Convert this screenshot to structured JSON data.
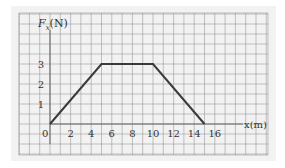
{
  "chart_data": {
    "type": "line",
    "title": "",
    "xlabel": "x(m)",
    "ylabel": "F_x(N)",
    "x": [
      0,
      5,
      10,
      15
    ],
    "series": [
      {
        "name": "F_x",
        "values": [
          0,
          3,
          3,
          0
        ]
      }
    ],
    "x_ticks": [
      "0",
      "2",
      "4",
      "6",
      "8",
      "10",
      "12",
      "14",
      "16"
    ],
    "y_ticks": [
      "1",
      "2",
      "3"
    ],
    "xlim": [
      -3,
      21
    ],
    "ylim": [
      -1.5,
      5.5
    ],
    "grid": true,
    "legend": "none"
  },
  "labels": {
    "ylabel_main": "F",
    "ylabel_sub": "x",
    "ylabel_unit": "(N)",
    "xlabel": "x(m)"
  },
  "colors": {
    "background": "#f2f2f2",
    "grid": "#9a9a9a",
    "line": "#3a3a3a",
    "text": "#333333"
  }
}
